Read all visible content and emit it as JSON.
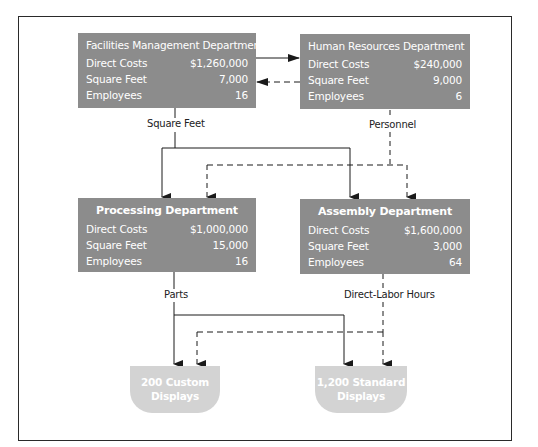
{
  "diagram": {
    "departments": {
      "facilities": {
        "title": "Facilities Management Department",
        "rows": [
          {
            "label": "Direct Costs",
            "value": "$1,260,000"
          },
          {
            "label": "Square Feet",
            "value": "7,000"
          },
          {
            "label": "Employees",
            "value": "16"
          }
        ]
      },
      "human_resources": {
        "title": "Human Resources Department",
        "rows": [
          {
            "label": "Direct Costs",
            "value": "$240,000"
          },
          {
            "label": "Square Feet",
            "value": "9,000"
          },
          {
            "label": "Employees",
            "value": "6"
          }
        ]
      },
      "processing": {
        "title": "Processing Department",
        "rows": [
          {
            "label": "Direct Costs",
            "value": "$1,000,000"
          },
          {
            "label": "Square Feet",
            "value": "15,000"
          },
          {
            "label": "Employees",
            "value": "16"
          }
        ]
      },
      "assembly": {
        "title": "Assembly Department",
        "rows": [
          {
            "label": "Direct Costs",
            "value": "$1,600,000"
          },
          {
            "label": "Square Feet",
            "value": "3,000"
          },
          {
            "label": "Employees",
            "value": "64"
          }
        ]
      }
    },
    "connector_labels": {
      "square_feet": "Square Feet",
      "personnel": "Personnel",
      "parts": "Parts",
      "direct_labor_hours": "Direct-Labor Hours"
    },
    "outputs": {
      "custom": {
        "line1": "200 Custom",
        "line2": "Displays"
      },
      "standard": {
        "line1": "1,200 Standard",
        "line2": "Displays"
      }
    },
    "colors": {
      "department_fill": "#8c8c8c",
      "output_fill": "#d3d3d3",
      "line": "#1a1a1a",
      "text_on_fill": "#ffffff"
    }
  }
}
